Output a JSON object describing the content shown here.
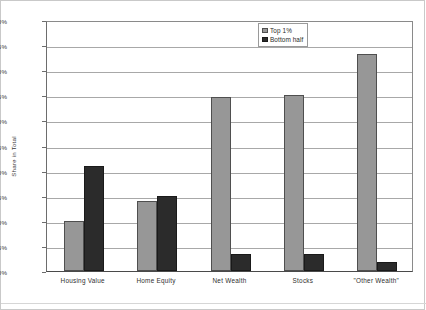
{
  "chart_data": {
    "type": "bar",
    "title": "",
    "subtitle": "",
    "xlabel": "",
    "ylabel": "Share in Total",
    "categories": [
      "Housing Value",
      "Home Equity",
      "Net Wealth",
      "Stocks",
      "\"Other Wealth\""
    ],
    "series": [
      {
        "name": "Top 1%",
        "color": "#979797",
        "values": [
          10.0,
          14.0,
          34.6,
          35.0,
          43.3
        ]
      },
      {
        "name": "Bottom half",
        "color": "#2b2b2b",
        "values": [
          21.0,
          15.0,
          3.4,
          3.3,
          1.8
        ]
      }
    ],
    "ylim": [
      0,
      50
    ],
    "yticks": [
      0,
      5,
      10,
      15,
      20,
      25,
      30,
      35,
      40,
      45,
      50
    ],
    "ytick_labels": [
      "0%",
      "5%",
      "10%",
      "15%",
      "20%",
      "25%",
      "30%",
      "35%",
      "40%",
      "45%",
      "50%"
    ],
    "grid": true,
    "legend_position": "top-right",
    "value_format": "percent"
  }
}
